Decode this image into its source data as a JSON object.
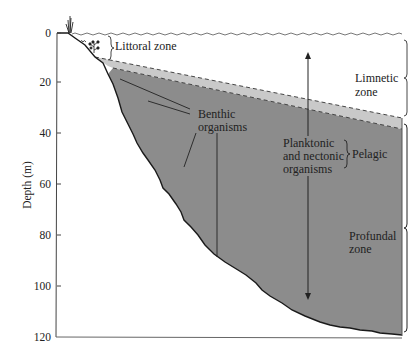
{
  "diagram": {
    "y_axis": {
      "label": "Depth (m)",
      "ticks": [
        "0",
        "20",
        "40",
        "60",
        "80",
        "100",
        "120"
      ]
    },
    "labels": {
      "littoral": "Littoral zone",
      "limnetic_line1": "Limnetic",
      "limnetic_line2": "zone",
      "benthic_line1": "Benthic",
      "benthic_line2": "organisms",
      "planktonic_line1": "Planktonic",
      "planktonic_line2": "and nectonic",
      "planktonic_line3": "organisms",
      "pelagic": "Pelagic",
      "profundal_line1": "Profundal",
      "profundal_line2": "zone"
    },
    "colors": {
      "light_band": "#c9c9c9",
      "deep_water": "#8c8c8c",
      "line": "#1a1a1a",
      "text": "#222222"
    }
  }
}
